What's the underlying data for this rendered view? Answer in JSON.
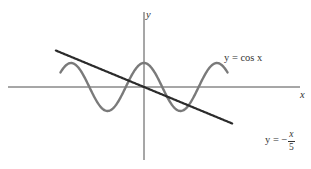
{
  "chart_data": {
    "type": "line",
    "title": "",
    "xlabel": "x",
    "ylabel": "y",
    "grid": false,
    "legend": "inline labels on curves",
    "x_range": [
      -7.9,
      7.9
    ],
    "y_range": [
      -1.5,
      1.8
    ],
    "ticks": {
      "x": [],
      "y": []
    },
    "series": [
      {
        "name": "y = cos x",
        "function": "cos(x)",
        "x_domain": [
          -7.2,
          7.2
        ],
        "color": "#7a7a7a",
        "style": "solid",
        "key_points": [
          {
            "x": -6.283,
            "y": 1
          },
          {
            "x": -3.142,
            "y": -1
          },
          {
            "x": 0,
            "y": 1
          },
          {
            "x": 3.142,
            "y": -1
          },
          {
            "x": 6.283,
            "y": 1
          }
        ]
      },
      {
        "name": "y = -x/5",
        "function": "-x/5",
        "x_domain": [
          -7.6,
          7.6
        ],
        "color": "#2b2b2b",
        "style": "solid",
        "key_points": [
          {
            "x": -7.6,
            "y": 1.52
          },
          {
            "x": 0,
            "y": 0
          },
          {
            "x": 7.6,
            "y": -1.52
          }
        ]
      }
    ],
    "annotations": [
      {
        "text": "y = cos x",
        "near": "cosine curve, upper right"
      },
      {
        "text": "y = -x/5",
        "near": "end of line, lower right"
      }
    ],
    "intersections_visible": 3
  },
  "labels": {
    "y_axis": "y",
    "x_axis": "x",
    "cos_label": "y = cos x",
    "line_label_prefix": "y = −",
    "line_label_num": "x",
    "line_label_den": "5"
  },
  "geometry": {
    "origin_px": [
      144,
      87
    ],
    "x_axis_px": [
      8,
      300
    ],
    "y_axis_px": [
      12,
      160
    ],
    "px_per_unit_x": 11.6,
    "px_per_unit_y": 24
  }
}
